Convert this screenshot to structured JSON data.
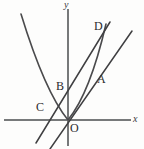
{
  "figure": {
    "kind": "coordinate-geometry-diagram",
    "background_color": "#fdfdfc",
    "axis_color": "#77797a",
    "curve_color": "#4a4a4c",
    "line_color": "#3f3f41",
    "axes": {
      "x_label": "x",
      "y_label": "y",
      "origin_label": "O",
      "origin_px": {
        "x": 68,
        "y": 120
      }
    },
    "point_labels": [
      {
        "name": "O",
        "text": "O",
        "x_px": 70,
        "y_px": 122
      },
      {
        "name": "B",
        "text": "B",
        "x_px": 56,
        "y_px": 80
      },
      {
        "name": "C",
        "text": "C",
        "x_px": 36,
        "y_px": 101
      },
      {
        "name": "A",
        "text": "A",
        "x_px": 97,
        "y_px": 73
      },
      {
        "name": "D",
        "text": "D",
        "x_px": 94,
        "y_px": 20
      }
    ],
    "curves": [
      {
        "name": "parabola",
        "type": "quadratic",
        "description": "upward-opening parabola with vertex at the origin O",
        "path": "M 21 14 Q 45 92 68 120 Q 90 93 106 24"
      }
    ],
    "lines": [
      {
        "name": "line-through-C-B-D",
        "description": "steep straight line passing through C on the x-axis, B on the y-axis, and D",
        "x1": 36,
        "y1": 143,
        "x2": 110,
        "y2": 22
      },
      {
        "name": "line-through-O-A",
        "description": "straight line through the origin O and point A",
        "x1": 50,
        "y1": 149,
        "x2": 132,
        "y2": 31
      }
    ],
    "axis_segments": [
      {
        "name": "x-axis",
        "x1": 4,
        "y1": 120,
        "x2": 131,
        "y2": 120
      },
      {
        "name": "y-axis",
        "x1": 68,
        "y1": 9,
        "x2": 68,
        "y2": 146
      }
    ]
  }
}
